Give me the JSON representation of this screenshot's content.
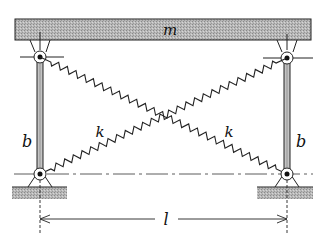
{
  "diagram": {
    "labels": {
      "mass": "m",
      "rod_left": "b",
      "rod_right": "b",
      "spring_left": "k",
      "spring_right": "k",
      "span": "l"
    },
    "components": [
      {
        "id": "beam",
        "type": "rigid-block",
        "label": "m"
      },
      {
        "id": "rod-left",
        "type": "rod",
        "label": "b"
      },
      {
        "id": "rod-right",
        "type": "rod",
        "label": "b"
      },
      {
        "id": "spring-1",
        "type": "spring",
        "label": "k",
        "from": "rod-left-bottom",
        "to": "rod-right-top"
      },
      {
        "id": "spring-2",
        "type": "spring",
        "label": "k",
        "from": "rod-left-top",
        "to": "rod-right-bottom"
      },
      {
        "id": "ground-left",
        "type": "ground-support"
      },
      {
        "id": "ground-right",
        "type": "ground-support"
      },
      {
        "id": "dimension-span",
        "type": "dimension",
        "label": "l"
      }
    ],
    "colors": {
      "ink": "#111111",
      "fill_grey": "#b5b5b5",
      "background": "#ffffff"
    }
  }
}
